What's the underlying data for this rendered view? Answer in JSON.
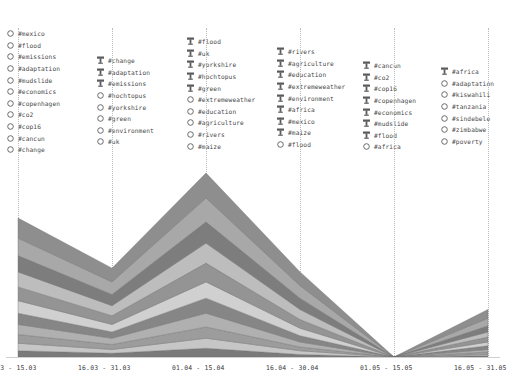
{
  "chart_data": {
    "type": "area",
    "title": "",
    "xlabel": "",
    "ylabel": "",
    "stacked": true,
    "grid": "vertical-dotted",
    "legend_position": "top",
    "palette": [
      "#8e8e8e",
      "#a8a8a8",
      "#7d7d7d",
      "#bdbdbd",
      "#949494",
      "#d0d0d0",
      "#868686",
      "#b0b0b0",
      "#9c9c9c",
      "#c6c6c6",
      "#7a7a7a"
    ],
    "x": [
      "01.03 - 15.03",
      "16.03 - 31.03",
      "01.04 - 15.04",
      "16.04 - 30.04",
      "01.05 - 15.05",
      "16.05 - 31.05"
    ],
    "categories": [
      "01.03 - 15.03",
      "16.03 - 31.03",
      "01.04 - 15.04",
      "16.04 - 30.04",
      "01.05 - 15.05",
      "16.05 - 31.05"
    ],
    "series": [
      {
        "name": "band-1",
        "values": [
          16,
          11,
          20,
          11,
          0,
          7
        ]
      },
      {
        "name": "band-2",
        "values": [
          14,
          10,
          19,
          10,
          0,
          6
        ]
      },
      {
        "name": "band-3",
        "values": [
          13,
          9,
          17,
          9,
          0,
          5
        ]
      },
      {
        "name": "band-4",
        "values": [
          12,
          8,
          16,
          8,
          0,
          4
        ]
      },
      {
        "name": "band-5",
        "values": [
          11,
          7,
          15,
          7,
          0,
          4
        ]
      },
      {
        "name": "band-6",
        "values": [
          10,
          6,
          13,
          6,
          0,
          3
        ]
      },
      {
        "name": "band-7",
        "values": [
          9,
          5,
          12,
          5,
          0,
          3
        ]
      },
      {
        "name": "band-8",
        "values": [
          8,
          5,
          11,
          4,
          0,
          2
        ]
      },
      {
        "name": "band-9",
        "values": [
          7,
          4,
          9,
          3,
          0,
          2
        ]
      },
      {
        "name": "band-10",
        "values": [
          6,
          3,
          8,
          3,
          0,
          1
        ]
      },
      {
        "name": "band-11",
        "values": [
          5,
          3,
          7,
          2,
          0,
          1
        ]
      }
    ]
  },
  "axis": {
    "ticks": [
      {
        "label": "01.03 - 15.03"
      },
      {
        "label": "16.03 - 31.03"
      },
      {
        "label": "01.04 - 15.04"
      },
      {
        "label": "16.04 - 30.04"
      },
      {
        "label": "01.05 - 15.05"
      },
      {
        "label": "16.05 - 31.05"
      }
    ]
  },
  "legend": {
    "columns": [
      {
        "items": [
          {
            "marker": "circle",
            "label": "#mexico"
          },
          {
            "marker": "circle",
            "label": "#flood"
          },
          {
            "marker": "circle",
            "label": "#emissions"
          },
          {
            "marker": "circle",
            "label": "#adaptation"
          },
          {
            "marker": "circle",
            "label": "#mudslide"
          },
          {
            "marker": "circle",
            "label": "#economics"
          },
          {
            "marker": "circle",
            "label": "#copenhagen"
          },
          {
            "marker": "circle",
            "label": "#co2"
          },
          {
            "marker": "circle",
            "label": "#cop16"
          },
          {
            "marker": "circle",
            "label": "#cancun"
          },
          {
            "marker": "circle",
            "label": "#change"
          }
        ]
      },
      {
        "items": [
          {
            "marker": "pin",
            "label": "#change"
          },
          {
            "marker": "pin",
            "label": "#adaptation"
          },
          {
            "marker": "pin",
            "label": "#emissions"
          },
          {
            "marker": "circle",
            "label": "#hochtopus"
          },
          {
            "marker": "circle",
            "label": "#yorkshire"
          },
          {
            "marker": "circle",
            "label": "#green"
          },
          {
            "marker": "circle",
            "label": "#environment"
          },
          {
            "marker": "circle",
            "label": "#uk"
          }
        ]
      },
      {
        "items": [
          {
            "marker": "pin",
            "label": "#flood"
          },
          {
            "marker": "pin",
            "label": "#uk"
          },
          {
            "marker": "pin",
            "label": "#yorkshire"
          },
          {
            "marker": "pin",
            "label": "#hochtopus"
          },
          {
            "marker": "pin",
            "label": "#green"
          },
          {
            "marker": "circle",
            "label": "#extremeweather"
          },
          {
            "marker": "circle",
            "label": "#education"
          },
          {
            "marker": "circle",
            "label": "#agriculture"
          },
          {
            "marker": "circle",
            "label": "#rivers"
          },
          {
            "marker": "circle",
            "label": "#maize"
          }
        ]
      },
      {
        "items": [
          {
            "marker": "pin",
            "label": "#rivers"
          },
          {
            "marker": "pin",
            "label": "#agriculture"
          },
          {
            "marker": "pin",
            "label": "#education"
          },
          {
            "marker": "pin",
            "label": "#extremeweather"
          },
          {
            "marker": "pin",
            "label": "#environment"
          },
          {
            "marker": "pin",
            "label": "#africa"
          },
          {
            "marker": "pin",
            "label": "#mexico"
          },
          {
            "marker": "pin",
            "label": "#maize"
          },
          {
            "marker": "circle",
            "label": "#flood"
          }
        ]
      },
      {
        "items": [
          {
            "marker": "pin",
            "label": "#cancun"
          },
          {
            "marker": "pin",
            "label": "#co2"
          },
          {
            "marker": "pin",
            "label": "#cop16"
          },
          {
            "marker": "pin",
            "label": "#copenhagen"
          },
          {
            "marker": "pin",
            "label": "#economics"
          },
          {
            "marker": "pin",
            "label": "#mudslide"
          },
          {
            "marker": "pin",
            "label": "#flood"
          },
          {
            "marker": "circle",
            "label": "#africa"
          }
        ]
      },
      {
        "items": [
          {
            "marker": "pin",
            "label": "#africa"
          },
          {
            "marker": "circle",
            "label": "#adaptation"
          },
          {
            "marker": "circle",
            "label": "#kiswahili"
          },
          {
            "marker": "circle",
            "label": "#tanzania"
          },
          {
            "marker": "circle",
            "label": "#sindebele"
          },
          {
            "marker": "circle",
            "label": "#zimbabwe"
          },
          {
            "marker": "circle",
            "label": "#poverty"
          }
        ]
      }
    ]
  }
}
